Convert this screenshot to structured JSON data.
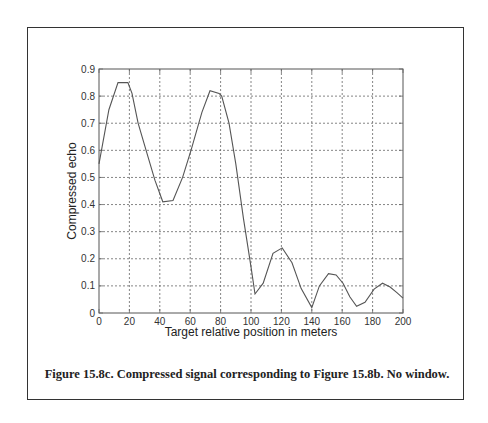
{
  "figure": {
    "caption": "Figure 15.8c. Compressed signal corresponding to Figure 15.8b. No window."
  },
  "chart_data": {
    "type": "line",
    "title": "",
    "xlabel": "Target relative position in meters",
    "ylabel": "Compressed echo",
    "xlim": [
      0,
      200
    ],
    "ylim": [
      0,
      0.9
    ],
    "xticks": [
      0,
      20,
      40,
      60,
      80,
      100,
      120,
      140,
      160,
      180,
      200
    ],
    "xtick_labels": [
      "0",
      "20",
      "40",
      "60",
      "80",
      "100",
      "120",
      "140",
      "160",
      "180",
      "200"
    ],
    "yticks": [
      0,
      0.1,
      0.2,
      0.3,
      0.4,
      0.5,
      0.6,
      0.7,
      0.8,
      0.9
    ],
    "ytick_labels": [
      "0",
      "0.1",
      "0.2",
      "0.3",
      "0.4",
      "0.5",
      "0.6",
      "0.7",
      "0.8",
      "0.9"
    ],
    "grid": true,
    "grid_style": "dotted",
    "legend": false,
    "line_color": "#555555",
    "series": [
      {
        "name": "Compressed echo",
        "x": [
          0,
          6.5,
          12.5,
          19,
          21.7,
          25.7,
          31,
          36.8,
          42,
          48.7,
          55,
          60.5,
          67.7,
          73,
          79,
          80.7,
          85.5,
          90,
          95,
          100,
          102.6,
          108,
          114.5,
          120.5,
          127,
          133,
          140,
          145,
          151,
          156,
          160.5,
          165,
          169.5,
          175,
          181,
          186.5,
          191.5,
          196,
          200
        ],
        "y": [
          0.55,
          0.75,
          0.85,
          0.85,
          0.81,
          0.7,
          0.6,
          0.49,
          0.41,
          0.415,
          0.5,
          0.6,
          0.74,
          0.82,
          0.81,
          0.8,
          0.7,
          0.55,
          0.35,
          0.17,
          0.07,
          0.11,
          0.22,
          0.24,
          0.185,
          0.09,
          0.02,
          0.1,
          0.145,
          0.14,
          0.11,
          0.06,
          0.025,
          0.04,
          0.088,
          0.11,
          0.096,
          0.075,
          0.055
        ]
      }
    ]
  }
}
